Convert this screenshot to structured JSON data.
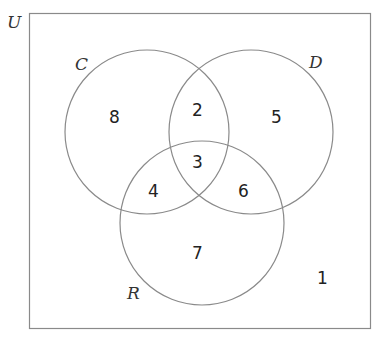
{
  "diagram": {
    "type": "venn-3",
    "universe": {
      "label": "U"
    },
    "sets": [
      {
        "label": "C"
      },
      {
        "label": "D"
      },
      {
        "label": "R"
      }
    ],
    "regions": {
      "C_only": "8",
      "C_and_D_only": "2",
      "D_only": "5",
      "C_and_D_and_R": "3",
      "C_and_R_only": "4",
      "D_and_R_only": "6",
      "R_only": "7",
      "outside": "1"
    },
    "colors": {
      "stroke": "#8a8a8a",
      "text": "#222222"
    }
  }
}
